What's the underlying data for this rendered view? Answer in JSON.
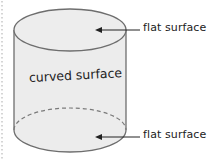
{
  "diagram": {
    "shape": "cylinder",
    "labels": {
      "top": "flat surface",
      "side": "curved surface",
      "bottom": "flat surface"
    },
    "colors": {
      "fill": "#ececec",
      "stroke": "#6e6e6e",
      "dashed_stroke": "#7a7a7a",
      "arrow": "#222222",
      "margin_dots": "#c8c8c8",
      "text": "#222222"
    }
  }
}
